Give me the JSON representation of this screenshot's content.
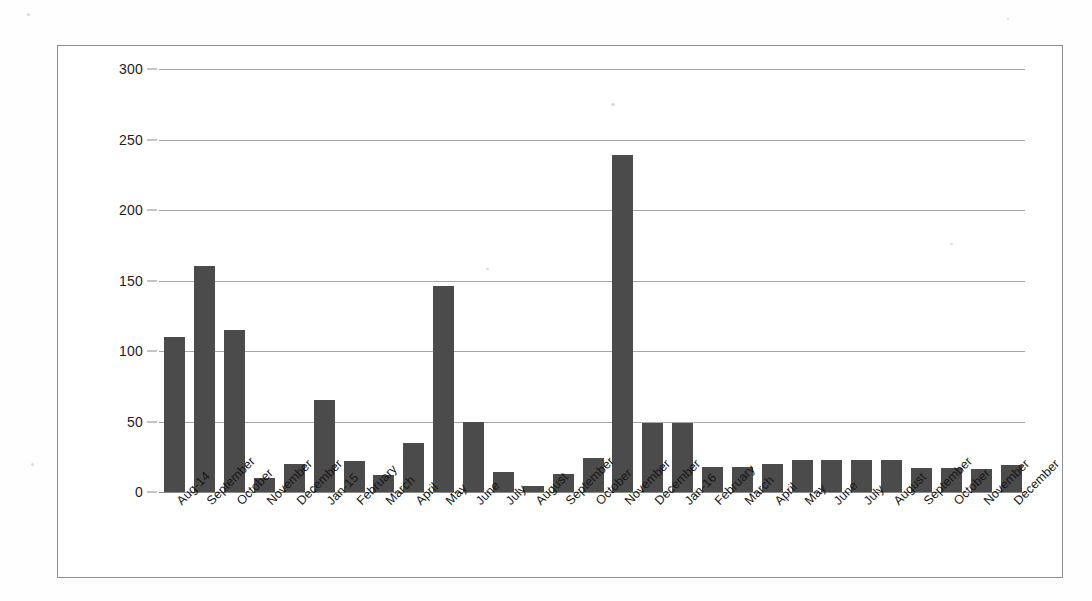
{
  "chart_data": {
    "type": "bar",
    "title": "",
    "subtitle": "",
    "xlabel": "",
    "ylabel": "",
    "ylim": [
      0,
      300
    ],
    "ytick_step": 50,
    "yticks": [
      0,
      50,
      100,
      150,
      200,
      250,
      300
    ],
    "grid": true,
    "legend": false,
    "legend_position": "none",
    "bar_color": "#4b4b4b",
    "gridline_color": "#a6a6a6",
    "frame_color": "#8d8d8d",
    "categories": [
      "Aug-14",
      "September",
      "October",
      "November",
      "December",
      "Jan-15",
      "February",
      "March",
      "April",
      "May",
      "June",
      "July",
      "August",
      "September",
      "October",
      "November",
      "December",
      "Jan-16",
      "February",
      "March",
      "April",
      "May",
      "June",
      "July",
      "August",
      "September",
      "October",
      "November",
      "December"
    ],
    "values": [
      110,
      160,
      115,
      10,
      20,
      65,
      22,
      12,
      35,
      146,
      50,
      14,
      4,
      13,
      24,
      239,
      49,
      49,
      18,
      18,
      20,
      23,
      23,
      23,
      23,
      17,
      17,
      16,
      19
    ]
  }
}
